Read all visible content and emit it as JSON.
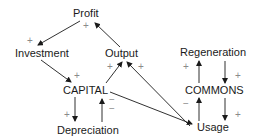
{
  "diagram": {
    "nodes": {
      "profit": "Profit",
      "investment": "Investment",
      "output": "Output",
      "capital": "CAPITAL",
      "depreciation": "Depreciation",
      "regeneration": "Regeneration",
      "commons": "COMMONS",
      "usage": "Usage"
    },
    "signs": {
      "profit_to_investment": "+",
      "output_to_profit": "+",
      "investment_to_capital": "+",
      "capital_to_output": "+",
      "usage_to_output": "+",
      "capital_to_usage": "−",
      "capital_to_depreciation": "+",
      "depreciation_to_capital": "−",
      "commons_to_regeneration": "+",
      "regeneration_to_commons": "+",
      "usage_to_commons": "−",
      "commons_to_usage": "+"
    },
    "edges": [
      {
        "from": "Profit",
        "to": "Investment",
        "sign": "+"
      },
      {
        "from": "Output",
        "to": "Profit",
        "sign": "+"
      },
      {
        "from": "Investment",
        "to": "CAPITAL",
        "sign": "+"
      },
      {
        "from": "CAPITAL",
        "to": "Output",
        "sign": "+"
      },
      {
        "from": "Usage",
        "to": "Output",
        "sign": "+"
      },
      {
        "from": "CAPITAL",
        "to": "Usage",
        "sign": "−"
      },
      {
        "from": "CAPITAL",
        "to": "Depreciation",
        "sign": "+"
      },
      {
        "from": "Depreciation",
        "to": "CAPITAL",
        "sign": "−"
      },
      {
        "from": "COMMONS",
        "to": "Regeneration",
        "sign": "+"
      },
      {
        "from": "Regeneration",
        "to": "COMMONS",
        "sign": "+"
      },
      {
        "from": "Usage",
        "to": "COMMONS",
        "sign": "−"
      },
      {
        "from": "COMMONS",
        "to": "Usage",
        "sign": "+"
      }
    ]
  }
}
